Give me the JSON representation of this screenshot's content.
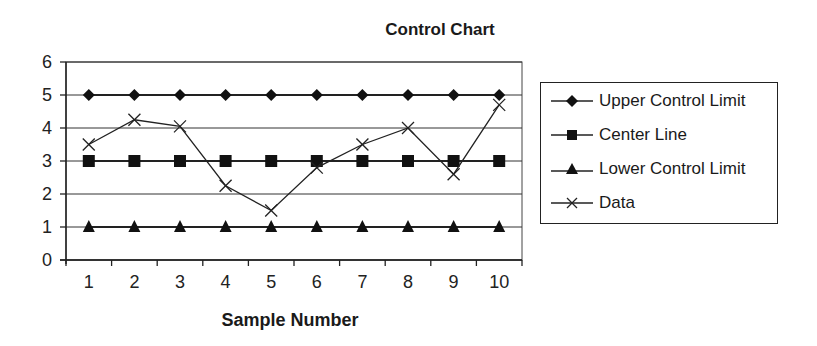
{
  "chart_data": {
    "type": "line",
    "title": "Control Chart",
    "xlabel": "Sample Number",
    "ylabel": "",
    "categories": [
      1,
      2,
      3,
      4,
      5,
      6,
      7,
      8,
      9,
      10
    ],
    "ylim": [
      0,
      6
    ],
    "yticks": [
      0,
      1,
      2,
      3,
      4,
      5,
      6
    ],
    "grid": true,
    "legend_position": "right",
    "series": [
      {
        "name": "Upper Control Limit",
        "marker": "diamond",
        "values": [
          5,
          5,
          5,
          5,
          5,
          5,
          5,
          5,
          5,
          5
        ]
      },
      {
        "name": "Center Line",
        "marker": "square",
        "values": [
          3,
          3,
          3,
          3,
          3,
          3,
          3,
          3,
          3,
          3
        ]
      },
      {
        "name": "Lower Control Limit",
        "marker": "triangle",
        "values": [
          1,
          1,
          1,
          1,
          1,
          1,
          1,
          1,
          1,
          1
        ]
      },
      {
        "name": "Data",
        "marker": "x",
        "values": [
          3.5,
          4.25,
          4.05,
          2.25,
          1.5,
          2.8,
          3.5,
          4.0,
          2.6,
          4.7
        ]
      }
    ]
  },
  "legend": {
    "items": [
      {
        "label": "Upper Control Limit"
      },
      {
        "label": "Center Line"
      },
      {
        "label": "Lower Control Limit"
      },
      {
        "label": "Data"
      }
    ]
  }
}
